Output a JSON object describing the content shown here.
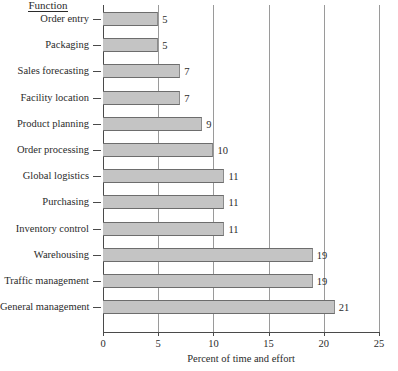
{
  "chart_data": {
    "type": "bar",
    "orientation": "horizontal",
    "title": "",
    "category_axis_title": "Function",
    "xlabel": "Percent of time and effort",
    "ylabel": "Function",
    "xlim": [
      0,
      25
    ],
    "xticks": [
      0,
      5,
      10,
      15,
      20,
      25
    ],
    "xtick_labels": [
      "0",
      "5",
      "10",
      "15",
      "20",
      "25"
    ],
    "grid": "vertical",
    "legend": "none",
    "bar_color": "#c4c4c4",
    "bar_edge_color": "#6d6d6d",
    "categories": [
      "Order entry",
      "Packaging",
      "Sales forecasting",
      "Facility location",
      "Product planning",
      "Order processing",
      "Global logistics",
      "Purchasing",
      "Inventory control",
      "Warehousing",
      "Traffic management",
      "General management"
    ],
    "values": [
      5,
      5,
      7,
      7,
      9,
      10,
      11,
      11,
      11,
      19,
      19,
      21
    ],
    "value_labels": [
      "5",
      "5",
      "7",
      "7",
      "9",
      "10",
      "11",
      "11",
      "11",
      "19",
      "19",
      "21"
    ]
  }
}
